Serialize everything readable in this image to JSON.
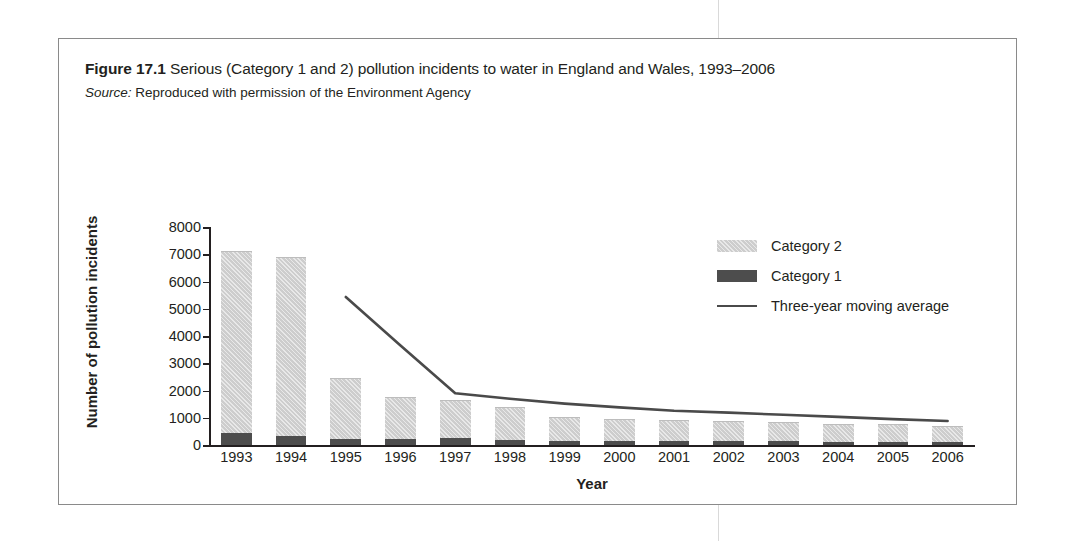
{
  "caption": {
    "figure_label": "Figure 17.1",
    "text": "Serious (Category 1 and 2) pollution incidents to water in England and Wales, 1993–2006",
    "source_label": "Source:",
    "source_text": "Reproduced with permission of the Environment Agency"
  },
  "colors": {
    "category2": "#cdcdcd",
    "category1": "#4d4d4d",
    "line": "#4a4a4a",
    "axis": "#231f20",
    "frame": "#8a8a8a"
  },
  "legend": {
    "position": "top-right",
    "items": [
      {
        "label": "Category 2",
        "marker": "swatch-hatched-light"
      },
      {
        "label": "Category 1",
        "marker": "swatch-solid-dark"
      },
      {
        "label": "Three-year moving average",
        "marker": "line"
      }
    ]
  },
  "chart_data": {
    "type": "bar",
    "title": "Serious (Category 1 and 2) pollution incidents to water in England and Wales, 1993–2006",
    "xlabel": "Year",
    "ylabel": "Number of pollution incidents",
    "ylim": [
      0,
      8000
    ],
    "ytick_step": 1000,
    "yticks": [
      0,
      1000,
      2000,
      3000,
      4000,
      5000,
      6000,
      7000,
      8000
    ],
    "grid": false,
    "stacked": true,
    "categories": [
      "1993",
      "1994",
      "1995",
      "1996",
      "1997",
      "1998",
      "1999",
      "2000",
      "2001",
      "2002",
      "2003",
      "2004",
      "2005",
      "2006"
    ],
    "series": [
      {
        "name": "Category 1",
        "type": "bar",
        "values": [
          430,
          330,
          230,
          210,
          270,
          170,
          150,
          140,
          140,
          130,
          130,
          120,
          120,
          110
        ]
      },
      {
        "name": "Category 2",
        "type": "bar",
        "values": [
          6670,
          6520,
          2200,
          1520,
          1350,
          1200,
          850,
          770,
          740,
          720,
          660,
          620,
          600,
          540
        ]
      },
      {
        "name": "Three-year moving average",
        "type": "line",
        "x": [
          "1995",
          "1996",
          "1997",
          "1998",
          "1999",
          "2000",
          "2001",
          "2002",
          "2003",
          "2004",
          "2005",
          "2006"
        ],
        "values": [
          5430,
          3650,
          1900,
          1700,
          1520,
          1380,
          1260,
          1190,
          1110,
          1030,
          950,
          880
        ]
      }
    ],
    "totals": [
      7100,
      6850,
      2430,
      1730,
      1620,
      1370,
      1000,
      910,
      880,
      850,
      790,
      740,
      720,
      650
    ]
  }
}
